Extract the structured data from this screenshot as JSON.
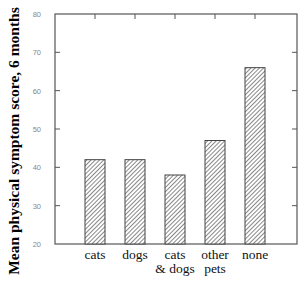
{
  "chart_data": {
    "type": "bar",
    "title": "",
    "xlabel": "",
    "ylabel": "Mean physical symptom score, 6 months",
    "categories": [
      "cats",
      "dogs",
      "cats & dogs",
      "other pets",
      "none"
    ],
    "category_label_lines": [
      [
        "cats",
        ""
      ],
      [
        "dogs",
        ""
      ],
      [
        "cats",
        "& dogs"
      ],
      [
        "other",
        "pets"
      ],
      [
        "none",
        ""
      ]
    ],
    "values": [
      42,
      42,
      38,
      47,
      66
    ],
    "ylim": [
      20,
      80
    ],
    "yticks": [
      20,
      30,
      40,
      50,
      60,
      70,
      80
    ],
    "grid": false,
    "legend": null,
    "bar_fill": "diagonal-hatch",
    "colors": {
      "axis": "#555555",
      "bar_stroke": "#444444",
      "hatch": "#555555",
      "tick_label": "#888888"
    }
  }
}
